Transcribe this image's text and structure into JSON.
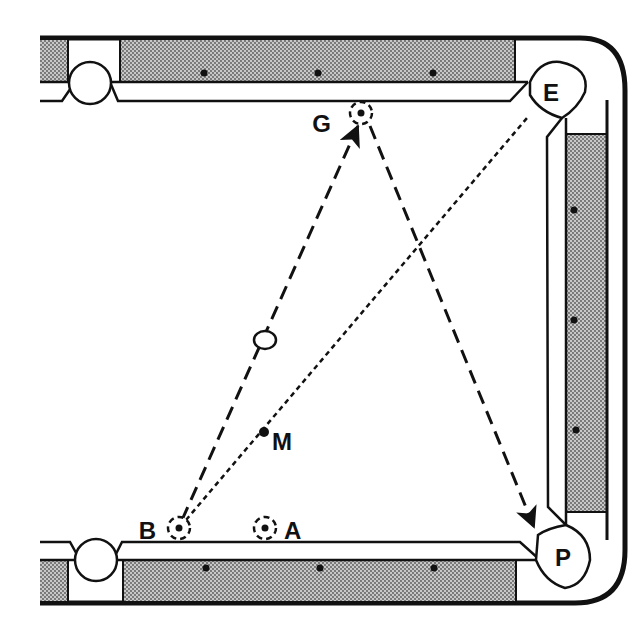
{
  "diagram": {
    "colors": {
      "ink": "#111111",
      "cloth": "#ffffff",
      "rail_pattern_dot": "#555555",
      "rail_pattern_bg": "#bdbdbd"
    },
    "pockets": [
      {
        "id": "E",
        "label": "E",
        "position": "top-right corner"
      },
      {
        "id": "P",
        "label": "P",
        "position": "bottom-right corner"
      },
      {
        "id": "top-left-side",
        "label": "",
        "position": "top-left side pocket"
      },
      {
        "id": "bottom-left-side",
        "label": "",
        "position": "bottom-left side pocket"
      }
    ],
    "points": [
      {
        "id": "G",
        "label": "G",
        "type": "ghost-ball target (dashed circle)"
      },
      {
        "id": "B",
        "label": "B",
        "type": "ghost ball (dashed circle)"
      },
      {
        "id": "A",
        "label": "A",
        "type": "ghost ball (dashed circle)"
      },
      {
        "id": "M",
        "label": "M",
        "type": "midpoint dot"
      },
      {
        "id": "cue",
        "label": "",
        "type": "open ball on path"
      }
    ],
    "paths": [
      {
        "from": "B",
        "to": "G",
        "style": "dashed with arrow"
      },
      {
        "from": "G",
        "to": "P",
        "style": "dashed with arrow"
      },
      {
        "from": "B",
        "to": "E",
        "style": "dotted (through M)"
      }
    ],
    "diamonds": {
      "top_rail": 3,
      "bottom_rail": 3,
      "right_rail": 3
    }
  }
}
